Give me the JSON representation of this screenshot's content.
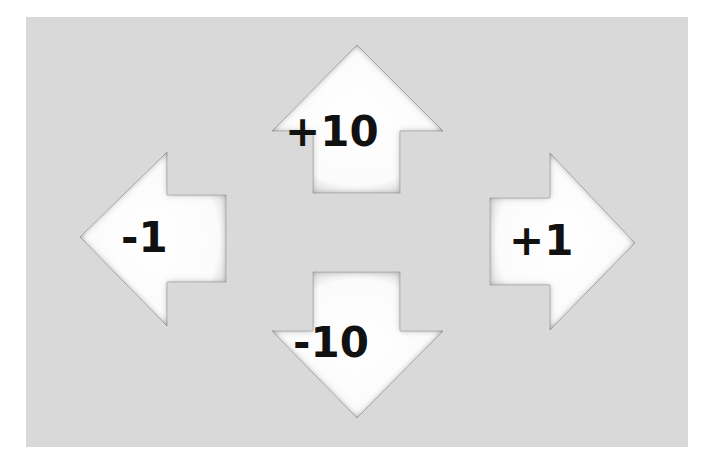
{
  "panel": {
    "background": "#d9d9d9"
  },
  "arrows": {
    "up": {
      "label": "+10",
      "direction": "up",
      "icon": "arrow-up-icon"
    },
    "left": {
      "label": "-1",
      "direction": "left",
      "icon": "arrow-left-icon"
    },
    "right": {
      "label": "+1",
      "direction": "right",
      "icon": "arrow-right-icon"
    },
    "down": {
      "label": "-10",
      "direction": "down",
      "icon": "arrow-down-icon"
    }
  }
}
